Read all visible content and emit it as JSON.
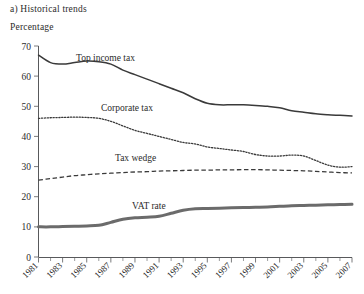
{
  "figure": {
    "title": "a) Historical trends",
    "axis_title": "Percentage"
  },
  "chart_data": {
    "type": "line",
    "title": "a) Historical trends",
    "xlabel": "",
    "ylabel": "Percentage",
    "ylim": [
      0,
      70
    ],
    "xlim": [
      1981,
      2007
    ],
    "yticks": [
      0,
      10,
      20,
      30,
      40,
      50,
      60,
      70
    ],
    "grid": false,
    "legend": "inline-labels",
    "x": [
      1981,
      1982,
      1983,
      1984,
      1985,
      1986,
      1987,
      1988,
      1989,
      1990,
      1991,
      1992,
      1993,
      1994,
      1995,
      1996,
      1997,
      1998,
      1999,
      2000,
      2001,
      2002,
      2003,
      2004,
      2005,
      2006,
      2007
    ],
    "xtick_labels": [
      "1981",
      "1983",
      "1985",
      "1987",
      "1989",
      "1991",
      "1993",
      "1995",
      "1997",
      "1999",
      "2001",
      "2003",
      "2005",
      "2007"
    ],
    "series": [
      {
        "name": "Top income tax",
        "style": "solid",
        "color": "#3a3a3a",
        "label": "Top income tax",
        "values": [
          67.0,
          64.5,
          64.0,
          64.5,
          65.0,
          64.8,
          64.0,
          62.0,
          60.5,
          59.0,
          57.5,
          56.0,
          54.5,
          52.5,
          51.0,
          50.5,
          50.5,
          50.5,
          50.3,
          50.0,
          49.5,
          48.5,
          48.0,
          47.5,
          47.2,
          47.0,
          46.8
        ]
      },
      {
        "name": "Corporate tax",
        "style": "dotted",
        "color": "#3a3a3a",
        "label": "Corporate tax",
        "values": [
          46.0,
          46.2,
          46.3,
          46.4,
          46.3,
          46.0,
          45.0,
          43.5,
          42.0,
          41.0,
          40.0,
          39.0,
          38.0,
          37.5,
          36.5,
          36.0,
          35.5,
          35.0,
          34.0,
          33.5,
          33.5,
          33.8,
          33.5,
          32.0,
          30.5,
          29.8,
          30.0
        ]
      },
      {
        "name": "Tax wedge",
        "style": "dashed",
        "color": "#3a3a3a",
        "label": "Tax wedge",
        "values": [
          25.5,
          26.0,
          26.5,
          27.0,
          27.3,
          27.6,
          27.8,
          28.0,
          28.2,
          28.3,
          28.5,
          28.6,
          28.7,
          28.8,
          28.8,
          28.9,
          28.9,
          29.0,
          29.0,
          28.9,
          28.8,
          28.7,
          28.6,
          28.4,
          28.2,
          28.0,
          27.9
        ]
      },
      {
        "name": "VAT rate",
        "style": "thick-solid",
        "color": "#6b6b6b",
        "label": "VAT rate",
        "values": [
          10.0,
          10.0,
          10.1,
          10.2,
          10.3,
          10.5,
          11.5,
          12.5,
          13.0,
          13.2,
          13.5,
          14.5,
          15.5,
          16.0,
          16.1,
          16.2,
          16.3,
          16.4,
          16.5,
          16.6,
          16.8,
          17.0,
          17.1,
          17.2,
          17.3,
          17.4,
          17.5
        ]
      }
    ]
  }
}
